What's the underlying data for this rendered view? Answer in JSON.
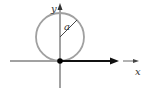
{
  "diagram": {
    "type": "geometry",
    "labels": {
      "x_axis": "x",
      "y_axis": "y",
      "radius": "a"
    },
    "colors": {
      "circle": "#a0a0a0",
      "axes": "#333333",
      "arrow": "#111111",
      "origin_point": "#000000",
      "background": "#ffffff"
    },
    "geometry": {
      "origin": [
        60,
        61
      ],
      "circle_center": [
        60,
        37
      ],
      "circle_radius": 24,
      "radius_endpoint": [
        77,
        20
      ],
      "x_axis_range": [
        10,
        118
      ],
      "y_axis_range": [
        4,
        88
      ],
      "bold_arrow": {
        "from": [
          60,
          61
        ],
        "to": [
          118,
          61
        ]
      },
      "small_arrow": {
        "from": [
          123,
          61
        ],
        "to": [
          138,
          61
        ]
      }
    }
  }
}
